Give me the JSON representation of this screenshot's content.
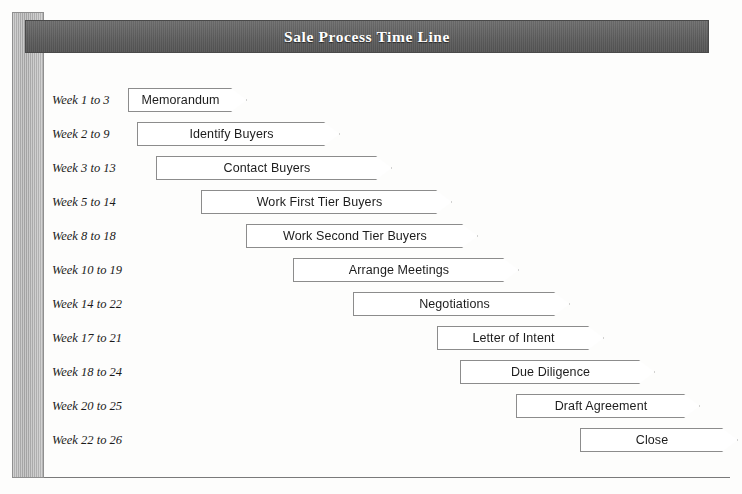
{
  "header": {
    "title": "Sale Process Time Line"
  },
  "colors": {
    "banner_background": "#5f5f5f",
    "banner_text": "#ffffff",
    "side_bar": "#b0b0b0",
    "arrow_fill": "#ffffff",
    "arrow_border": "#8c8c8c",
    "label_text": "#1a1a1a",
    "rule": "#7a7a7a"
  },
  "chart_data": {
    "type": "bar",
    "title": "Sale Process Time Line",
    "xlabel": "Week",
    "ylabel": "",
    "xlim": [
      1,
      26
    ],
    "grid": false,
    "legend": null,
    "categories": [
      "Memorandum",
      "Identify Buyers",
      "Contact Buyers",
      "Work First Tier Buyers",
      "Work Second Tier Buyers",
      "Arrange Meetings",
      "Negotiations",
      "Letter of Intent",
      "Due Diligence",
      "Draft Agreement",
      "Close"
    ],
    "start_weeks": [
      1,
      2,
      3,
      5,
      8,
      10,
      14,
      17,
      18,
      20,
      22
    ],
    "end_weeks": [
      3,
      9,
      13,
      14,
      18,
      19,
      22,
      21,
      24,
      25,
      26
    ],
    "durations": [
      2,
      7,
      10,
      9,
      10,
      9,
      8,
      4,
      6,
      5,
      4
    ]
  },
  "rows": [
    {
      "week_label": "Week 1 to 3",
      "task": "Memorandum",
      "start_week": 1,
      "end_week": 3,
      "top": 88,
      "left": 128,
      "width": 119
    },
    {
      "week_label": "Week 2 to 9",
      "task": "Identify Buyers",
      "start_week": 2,
      "end_week": 9,
      "top": 122,
      "left": 137,
      "width": 203
    },
    {
      "week_label": "Week 3 to 13",
      "task": "Contact Buyers",
      "start_week": 3,
      "end_week": 13,
      "top": 156,
      "left": 156,
      "width": 236
    },
    {
      "week_label": "Week 5 to 14",
      "task": "Work First Tier Buyers",
      "start_week": 5,
      "end_week": 14,
      "top": 190,
      "left": 201,
      "width": 251
    },
    {
      "week_label": "Week 8 to 18",
      "task": "Work Second Tier Buyers",
      "start_week": 8,
      "end_week": 18,
      "top": 224,
      "left": 246,
      "width": 232
    },
    {
      "week_label": "Week 10 to 19",
      "task": "Arrange Meetings",
      "start_week": 10,
      "end_week": 19,
      "top": 258,
      "left": 293,
      "width": 226
    },
    {
      "week_label": "Week 14 to 22",
      "task": "Negotiations",
      "start_week": 14,
      "end_week": 22,
      "top": 292,
      "left": 353,
      "width": 217
    },
    {
      "week_label": "Week 17 to 21",
      "task": "Letter of Intent",
      "start_week": 17,
      "end_week": 21,
      "top": 326,
      "left": 437,
      "width": 167
    },
    {
      "week_label": "Week 18 to 24",
      "task": "Due Diligence",
      "start_week": 18,
      "end_week": 24,
      "top": 360,
      "left": 460,
      "width": 195
    },
    {
      "week_label": "Week 20 to 25",
      "task": "Draft Agreement",
      "start_week": 20,
      "end_week": 25,
      "top": 394,
      "left": 516,
      "width": 184
    },
    {
      "week_label": "Week 22 to 26",
      "task": "Close",
      "start_week": 22,
      "end_week": 26,
      "top": 428,
      "left": 580,
      "width": 158
    }
  ]
}
